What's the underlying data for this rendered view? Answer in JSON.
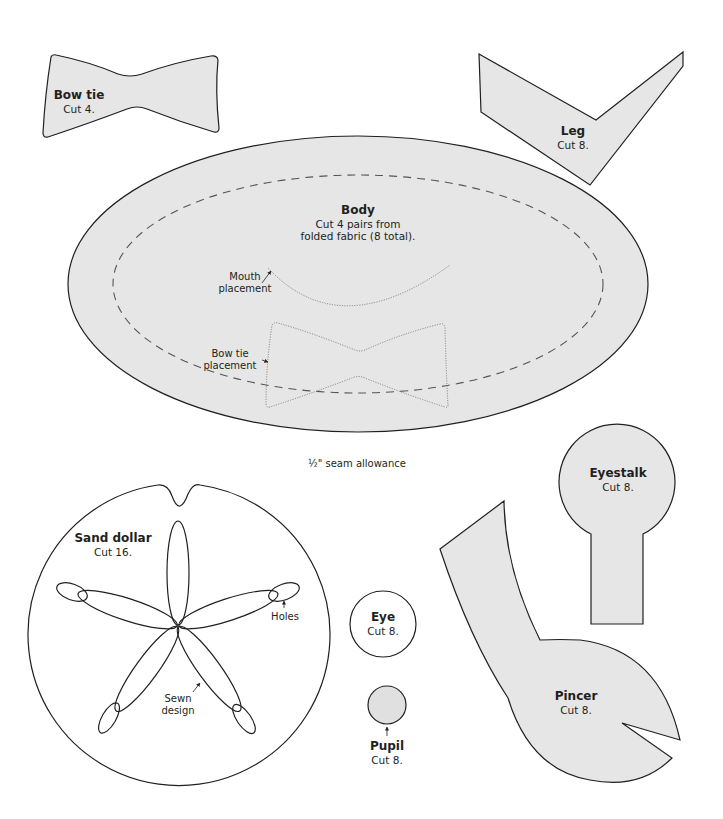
{
  "colors": {
    "fill": "#e6e6e6",
    "outline": "#231f20",
    "background": "#ffffff"
  },
  "pieces": {
    "bow_tie": {
      "title": "Bow tie",
      "instruction": "Cut 4."
    },
    "leg": {
      "title": "Leg",
      "instruction": "Cut 8."
    },
    "body": {
      "title": "Body",
      "instruction_line1": "Cut 4 pairs from",
      "instruction_line2": "folded fabric (8 total).",
      "mouth_note_line1": "Mouth",
      "mouth_note_line2": "placement",
      "bowtie_note_line1": "Bow tie",
      "bowtie_note_line2": "placement",
      "seam_note": "½\" seam allowance"
    },
    "eyestalk": {
      "title": "Eyestalk",
      "instruction": "Cut 8."
    },
    "sand_dollar": {
      "title": "Sand dollar",
      "instruction": "Cut 16.",
      "holes_note": "Holes",
      "sewn_note_line1": "Sewn",
      "sewn_note_line2": "design"
    },
    "eye": {
      "title": "Eye",
      "instruction": "Cut 8."
    },
    "pupil": {
      "title": "Pupil",
      "instruction": "Cut 8."
    },
    "pincer": {
      "title": "Pincer",
      "instruction": "Cut 8."
    }
  }
}
